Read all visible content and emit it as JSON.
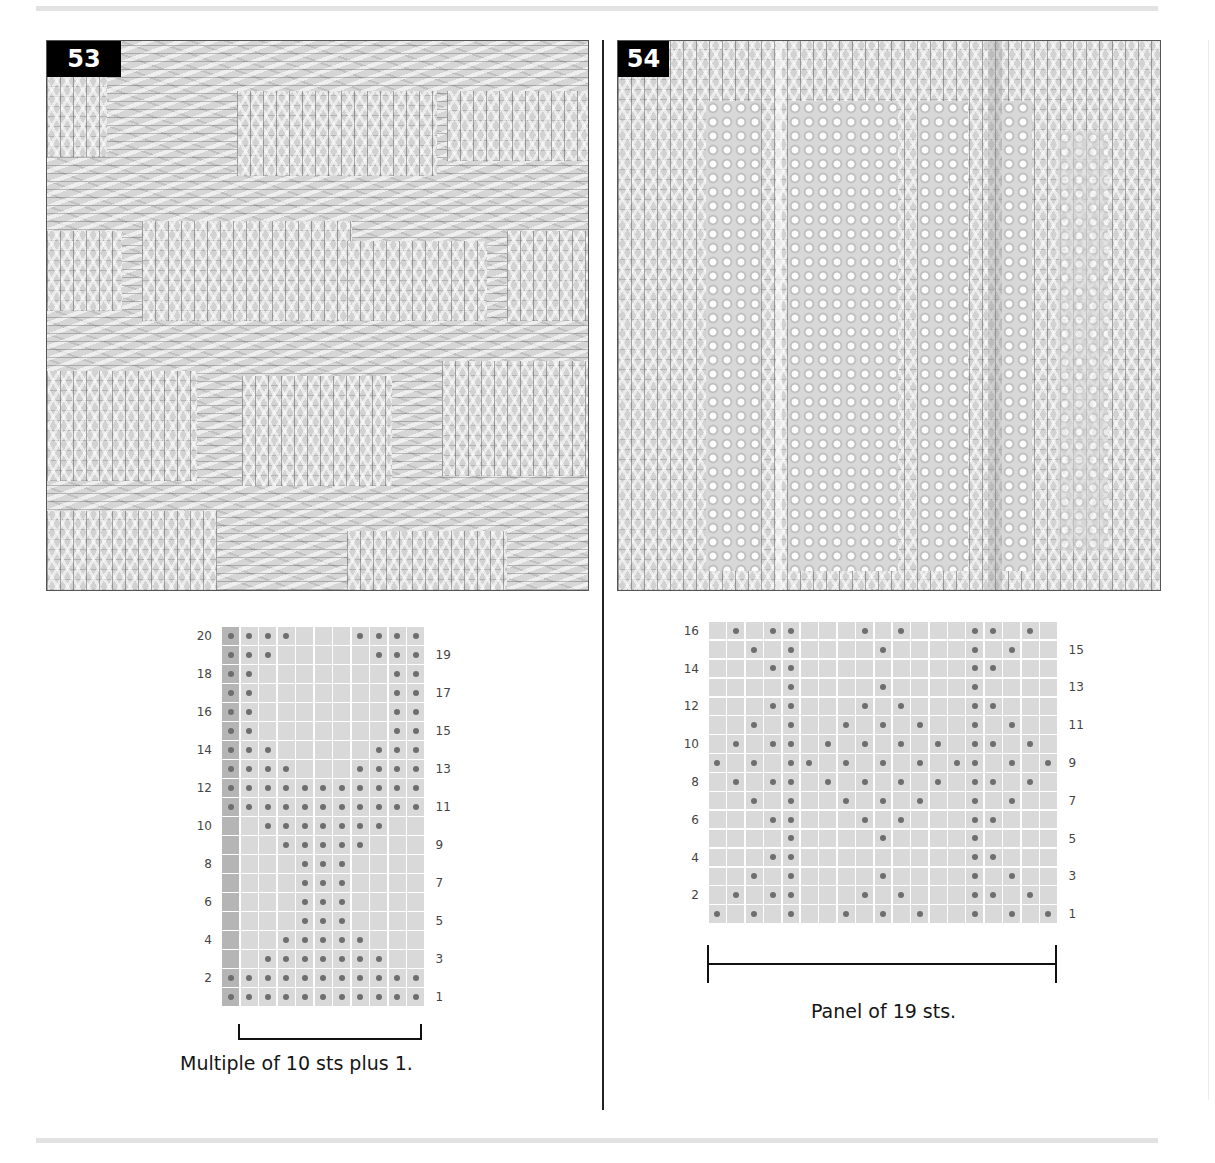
{
  "page": {
    "background": "#ffffff",
    "rule_color": "#e2e2e2"
  },
  "patterns": [
    {
      "number": "53",
      "photo_alt": "Knitted swatch: alternating stockinette blocks and garter bands forming stepped pyramid motifs",
      "chart": {
        "columns": 11,
        "rows": 20,
        "edge_column": 0,
        "left_labels": [
          "2",
          "4",
          "6",
          "8",
          "10",
          "12",
          "14",
          "16",
          "18",
          "20"
        ],
        "right_labels": [
          "1",
          "3",
          "5",
          "7",
          "9",
          "11",
          "13",
          "15",
          "17",
          "19"
        ],
        "dots_by_row": {
          "1": [
            0,
            1,
            2,
            3,
            4,
            5,
            6,
            7,
            8,
            9,
            10
          ],
          "2": [
            0,
            1,
            2,
            3,
            4,
            5,
            6,
            7,
            8,
            9,
            10
          ],
          "3": [
            2,
            3,
            4,
            5,
            6,
            7,
            8
          ],
          "4": [
            3,
            4,
            5,
            6,
            7
          ],
          "5": [
            4,
            5,
            6
          ],
          "6": [
            4,
            5,
            6
          ],
          "7": [
            4,
            5,
            6
          ],
          "8": [
            4,
            5,
            6
          ],
          "9": [
            3,
            4,
            5,
            6,
            7
          ],
          "10": [
            2,
            3,
            4,
            5,
            6,
            7,
            8
          ],
          "11": [
            0,
            1,
            2,
            3,
            4,
            5,
            6,
            7,
            8,
            9,
            10
          ],
          "12": [
            0,
            1,
            2,
            3,
            4,
            5,
            6,
            7,
            8,
            9,
            10
          ],
          "13": [
            0,
            1,
            2,
            3,
            7,
            8,
            9,
            10
          ],
          "14": [
            0,
            1,
            2,
            8,
            9,
            10
          ],
          "15": [
            0,
            1,
            9,
            10
          ],
          "16": [
            0,
            1,
            9,
            10
          ],
          "17": [
            0,
            1,
            9,
            10
          ],
          "18": [
            0,
            1,
            9,
            10
          ],
          "19": [
            0,
            1,
            2,
            8,
            9,
            10
          ],
          "20": [
            0,
            1,
            2,
            3,
            7,
            8,
            9,
            10
          ]
        }
      },
      "caption": "Multiple of 10 sts plus 1."
    },
    {
      "number": "54",
      "photo_alt": "Knitted swatch: vertical panels of seed-stitch diamonds separated by stockinette ribs",
      "chart": {
        "columns": 19,
        "rows": 16,
        "left_labels": [
          "2",
          "4",
          "6",
          "8",
          "10",
          "12",
          "14",
          "16"
        ],
        "right_labels": [
          "1",
          "3",
          "5",
          "7",
          "9",
          "11",
          "13",
          "15"
        ],
        "dots_by_row": {
          "1": [
            0,
            2,
            4,
            7,
            9,
            11,
            14,
            16,
            18
          ],
          "2": [
            1,
            3,
            4,
            8,
            10,
            14,
            15,
            17
          ],
          "3": [
            2,
            4,
            9,
            14,
            16
          ],
          "4": [
            3,
            4,
            14,
            15
          ],
          "5": [
            4,
            9,
            14
          ],
          "6": [
            3,
            4,
            8,
            10,
            14,
            15
          ],
          "7": [
            2,
            4,
            7,
            9,
            11,
            14,
            16
          ],
          "8": [
            1,
            3,
            4,
            6,
            8,
            10,
            12,
            14,
            15,
            17
          ],
          "9": [
            0,
            2,
            4,
            5,
            7,
            9,
            11,
            13,
            14,
            16,
            18
          ],
          "10": [
            1,
            3,
            4,
            6,
            8,
            10,
            12,
            14,
            15,
            17
          ],
          "11": [
            2,
            4,
            7,
            9,
            11,
            14,
            16
          ],
          "12": [
            3,
            4,
            8,
            10,
            14,
            15
          ],
          "13": [
            4,
            9,
            14
          ],
          "14": [
            3,
            4,
            14,
            15
          ],
          "15": [
            2,
            4,
            9,
            14,
            16
          ],
          "16": [
            1,
            3,
            4,
            8,
            10,
            14,
            15,
            17
          ]
        }
      },
      "caption": "Panel of 19 sts."
    }
  ],
  "legend": {
    "dot_color": "#6e6e6e",
    "cell_color": "#d9d9d9",
    "edge_cell_color": "#b5b5b5"
  }
}
